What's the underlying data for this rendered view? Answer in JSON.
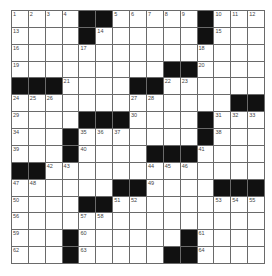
{
  "puzzle": {
    "rows": 15,
    "cols": 15,
    "grid": [
      [
        "1",
        "2",
        "3",
        "4",
        "#",
        "#",
        "5",
        "6",
        "7",
        "8",
        "9",
        "#",
        "10",
        "11",
        "12"
      ],
      [
        "13",
        "",
        "",
        "",
        "#",
        "14",
        "",
        "",
        "",
        "",
        "",
        "#",
        "15",
        "",
        ""
      ],
      [
        "16",
        "",
        "",
        "",
        "17",
        "",
        "",
        "",
        "",
        "",
        "",
        "18",
        "",
        "",
        ""
      ],
      [
        "19",
        "",
        "",
        "",
        "",
        "",
        "",
        "",
        "",
        "#",
        "#",
        "20",
        "",
        "",
        ""
      ],
      [
        "#",
        "#",
        "#",
        "21",
        "",
        "",
        "",
        "#",
        "#",
        "22",
        "23",
        "",
        "",
        "",
        ""
      ],
      [
        "24",
        "25",
        "26",
        "",
        "",
        "",
        "",
        "27",
        "28",
        "",
        "",
        "",
        "",
        "#",
        "#"
      ],
      [
        "29",
        "",
        "",
        "",
        "#",
        "#",
        "#",
        "30",
        "",
        "",
        "",
        "#",
        "31",
        "32",
        "33"
      ],
      [
        "34",
        "",
        "",
        "#",
        "35",
        "36",
        "37",
        "",
        "",
        "",
        "",
        "#",
        "38",
        "",
        ""
      ],
      [
        "39",
        "",
        "",
        "#",
        "40",
        "",
        "",
        "",
        "#",
        "#",
        "#",
        "41",
        "",
        "",
        ""
      ],
      [
        "#",
        "#",
        "42",
        "43",
        "",
        "",
        "",
        "",
        "44",
        "45",
        "46",
        "",
        "",
        "",
        ""
      ],
      [
        "47",
        "48",
        "",
        "",
        "",
        "",
        "#",
        "#",
        "49",
        "",
        "",
        "",
        "#",
        "#",
        "#"
      ],
      [
        "50",
        "",
        "",
        "",
        "#",
        "#",
        "51",
        "52",
        "",
        "",
        "",
        "",
        "53",
        "54",
        "55"
      ],
      [
        "56",
        "",
        "",
        "",
        "57",
        "58",
        "",
        "",
        "",
        "",
        "",
        "",
        "",
        "",
        ""
      ],
      [
        "59",
        "",
        "",
        "#",
        "60",
        "",
        "",
        "",
        "",
        "",
        "#",
        "61",
        "",
        "",
        ""
      ],
      [
        "62",
        "",
        "",
        "#",
        "63",
        "",
        "",
        "",
        "",
        "#",
        "#",
        "64",
        "",
        "",
        ""
      ]
    ]
  },
  "colors": {
    "black_square": "#111111",
    "white_square": "#ffffff",
    "grid_line": "#6a6a6a",
    "number_text": "#444444"
  }
}
